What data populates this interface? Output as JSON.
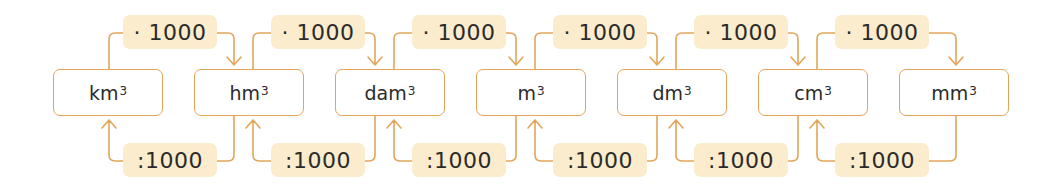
{
  "diagram": {
    "title": "",
    "colors": {
      "line": "#e3a55a",
      "label_bg": "#fbeccd",
      "text": "#2b2b2b"
    },
    "units": [
      {
        "base": "km",
        "exp": "3"
      },
      {
        "base": "hm",
        "exp": "3"
      },
      {
        "base": "dam",
        "exp": "3"
      },
      {
        "base": "m",
        "exp": "3"
      },
      {
        "base": "dm",
        "exp": "3"
      },
      {
        "base": "cm",
        "exp": "3"
      },
      {
        "base": "mm",
        "exp": "3"
      }
    ],
    "forward_labels": [
      "· 1000",
      "· 1000",
      "· 1000",
      "· 1000",
      "· 1000",
      "· 1000"
    ],
    "backward_labels": [
      ":1000",
      ":1000",
      ":1000",
      ":1000",
      ":1000",
      ":1000"
    ],
    "forward_direction": "left-to-right (multiply)",
    "backward_direction": "right-to-left (divide)"
  }
}
